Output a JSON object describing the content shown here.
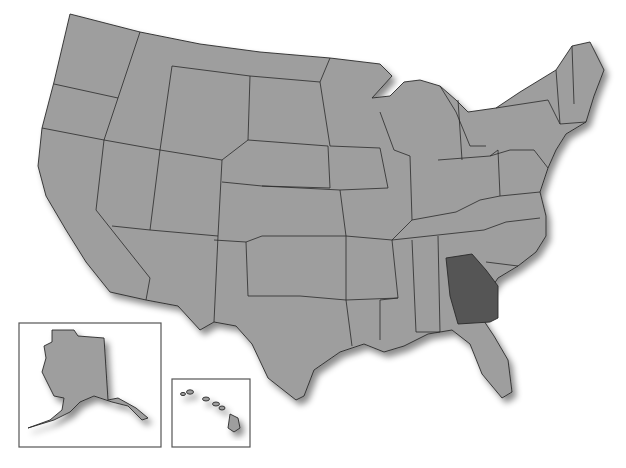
{
  "map": {
    "type": "us-states-outline",
    "highlighted_state": "Georgia",
    "colors": {
      "state_fill": "#9e9e9e",
      "highlight_fill": "#555555",
      "border": "#2a2a2a",
      "background": "#ffffff"
    },
    "insets": [
      {
        "label": "Alaska"
      },
      {
        "label": "Hawaii"
      }
    ]
  }
}
